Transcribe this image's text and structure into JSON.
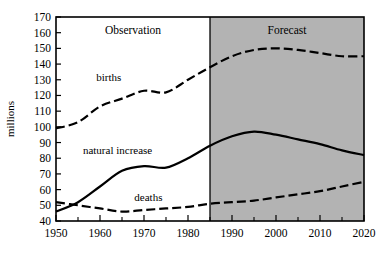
{
  "chart_data": {
    "type": "line",
    "title": "",
    "subtitle": "",
    "xlabel": "",
    "ylabel": "millions",
    "xlim": [
      1950,
      2020
    ],
    "ylim": [
      40,
      170
    ],
    "grid": false,
    "legend_position": "inline-annotations",
    "x_ticks_major": [
      1950,
      1960,
      1970,
      1980,
      1990,
      2000,
      2010,
      2020
    ],
    "x_tick_labels": [
      "1950",
      "1960",
      "1970",
      "1980",
      "1990",
      "2000",
      "2010",
      "2020"
    ],
    "x_ticks_minor": [
      1955,
      1965,
      1975,
      1985,
      1995,
      2005,
      2015
    ],
    "y_ticks": [
      40,
      50,
      60,
      70,
      80,
      90,
      100,
      110,
      120,
      130,
      140,
      150,
      160,
      170
    ],
    "y_tick_labels": [
      "40",
      "50",
      "60",
      "70",
      "80",
      "90",
      "100",
      "110",
      "120",
      "130",
      "140",
      "150",
      "160",
      "170"
    ],
    "regions": [
      {
        "name": "observation",
        "label": "Observation",
        "x_start": 1950,
        "x_end": 1985,
        "fill": "#ffffff"
      },
      {
        "name": "forecast",
        "label": "Forecast",
        "x_start": 1985,
        "x_end": 2020,
        "fill": "#b3b3b3"
      }
    ],
    "series": [
      {
        "name": "births",
        "label": "births",
        "style": "dashed",
        "color": "#000000",
        "x": [
          1950,
          1955,
          1960,
          1965,
          1970,
          1975,
          1980,
          1985,
          1990,
          1995,
          2000,
          2005,
          2010,
          2015,
          2020
        ],
        "values": [
          99,
          103,
          113,
          118,
          123,
          122,
          130,
          138,
          145,
          149,
          150,
          149,
          147,
          145,
          145
        ]
      },
      {
        "name": "natural-increase",
        "label": "natural increase",
        "style": "solid",
        "color": "#000000",
        "x": [
          1950,
          1955,
          1960,
          1965,
          1970,
          1975,
          1980,
          1985,
          1990,
          1995,
          2000,
          2005,
          2010,
          2015,
          2020
        ],
        "values": [
          46,
          52,
          62,
          72,
          75,
          74,
          80,
          88,
          94,
          97,
          95,
          92,
          89,
          85,
          82
        ]
      },
      {
        "name": "deaths",
        "label": "deaths",
        "style": "dashed",
        "color": "#000000",
        "x": [
          1950,
          1955,
          1960,
          1965,
          1970,
          1975,
          1980,
          1985,
          1990,
          1995,
          2000,
          2005,
          2010,
          2015,
          2020
        ],
        "values": [
          52,
          50,
          48,
          46,
          47,
          48,
          49,
          51,
          52,
          53,
          55,
          57,
          59,
          62,
          65
        ]
      }
    ],
    "annotations": [
      {
        "name": "births-label",
        "text": "births",
        "x": 1962,
        "y": 129
      },
      {
        "name": "natural-increase-label",
        "text": "natural increase",
        "x": 1964,
        "y": 83
      },
      {
        "name": "deaths-label",
        "text": "deaths",
        "x": 1971,
        "y": 53
      }
    ]
  }
}
